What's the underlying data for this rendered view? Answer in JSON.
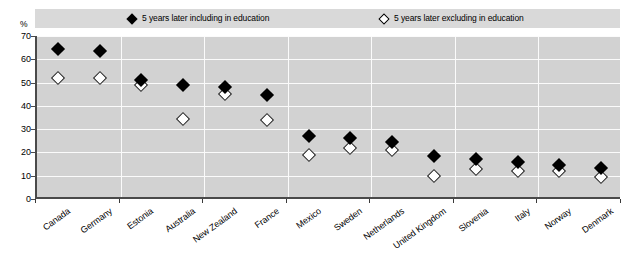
{
  "chart_data": {
    "type": "scatter",
    "title": "",
    "xlabel": "",
    "ylabel": "%",
    "ylim": [
      0,
      70
    ],
    "yticks": [
      0,
      10,
      20,
      30,
      40,
      50,
      60,
      70
    ],
    "grid": true,
    "legend_position": "top",
    "categories": [
      "Canada",
      "Germany",
      "Estonia",
      "Australia",
      "New Zealand",
      "France",
      "Mexico",
      "Sweden",
      "Netherlands",
      "United Kingdom",
      "Slovenia",
      "Italy",
      "Norway",
      "Denmark"
    ],
    "series": [
      {
        "name": "5 years later including in education",
        "marker": "filled-diamond",
        "color": "#000000",
        "values": [
          64.5,
          63.5,
          51,
          49,
          48,
          44.5,
          27,
          26,
          24.5,
          18.5,
          17,
          16,
          14.5,
          13.5
        ]
      },
      {
        "name": "5 years later excluding in education",
        "marker": "open-diamond",
        "color": "#ffffff",
        "values": [
          52,
          52,
          49,
          34.5,
          45,
          34,
          19,
          22,
          21,
          10,
          13,
          12,
          12,
          9.5
        ]
      }
    ]
  },
  "legend": {
    "items": [
      {
        "label": "5 years later including in education",
        "marker": "filled-diamond"
      },
      {
        "label": "5 years later excluding in education",
        "marker": "open-diamond"
      }
    ]
  },
  "axis": {
    "y_unit": "%"
  },
  "colors": {
    "plot_background": "#d2d2d2",
    "legend_background": "#d9d9d9",
    "gridline": "#fbfbfb",
    "axis_line": "#4a4a4a",
    "marker_filled": "#000000",
    "marker_open": "#ffffff"
  }
}
